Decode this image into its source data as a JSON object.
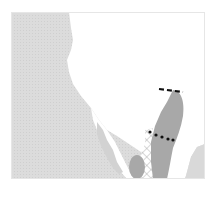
{
  "map": {
    "type": "range-map",
    "region": "southwestern North America / Baja California",
    "colors": {
      "background": "#ffffff",
      "ocean": "#d9d9d9",
      "land": "#ffffff",
      "range": "#a8a8a8",
      "hatch": "#b8b8b8",
      "markers": "#111111"
    },
    "layers": [
      {
        "id": "ocean",
        "label": ""
      },
      {
        "id": "land",
        "label": ""
      },
      {
        "id": "range-primary",
        "label": ""
      },
      {
        "id": "range-island",
        "label": ""
      },
      {
        "id": "range-hatched",
        "label": ""
      },
      {
        "id": "northern-limit-dashed-line",
        "label": ""
      },
      {
        "id": "dotted-boundary-line",
        "label": ""
      }
    ]
  }
}
